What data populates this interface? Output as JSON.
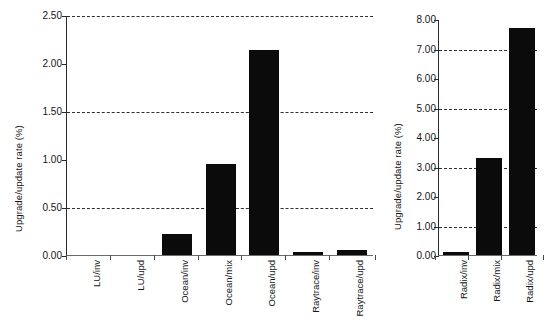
{
  "figure": {
    "background": "#ffffff",
    "bar_color": "#0b0b0b",
    "axis_color": "#2b2b2b",
    "grid_color": "#2e2e2e"
  },
  "chart_data": [
    {
      "type": "bar",
      "panel": "left",
      "title": "",
      "xlabel": "",
      "ylabel": "Upgrade/update rate (%)",
      "categories": [
        "LU/inv",
        "LU/upd",
        "Ocean/inv",
        "Ocean/mix",
        "Ocean/upd",
        "Raytrace/inv",
        "Raytrace/upd"
      ],
      "values": [
        0.0,
        0.0,
        0.22,
        0.95,
        2.14,
        0.03,
        0.05
      ],
      "ylim": [
        0.0,
        2.5
      ],
      "ytick_values": [
        0.0,
        0.5,
        1.0,
        1.5,
        2.0,
        2.5
      ],
      "ytick_labels": [
        "0.00",
        "0.50",
        "1.00",
        "1.50",
        "2.00",
        "2.50"
      ],
      "gridlines_at": [
        0.5,
        1.5,
        2.5
      ],
      "grid": "horizontal-dashed",
      "legend": "none"
    },
    {
      "type": "bar",
      "panel": "right",
      "title": "",
      "xlabel": "",
      "ylabel": "Upgrade/update rate (%)",
      "categories": [
        "Radix/inv",
        "Radix/mix",
        "Radix/upd"
      ],
      "values": [
        0.1,
        3.3,
        7.7
      ],
      "ylim": [
        0.0,
        8.0
      ],
      "ytick_values": [
        0.0,
        1.0,
        2.0,
        3.0,
        4.0,
        5.0,
        6.0,
        7.0,
        8.0
      ],
      "ytick_labels": [
        "0.00",
        "1.00",
        "2.00",
        "3.00",
        "4.00",
        "5.00",
        "6.00",
        "7.00",
        "8.00"
      ],
      "gridlines_at": [
        1.0,
        3.0,
        5.0,
        7.0
      ],
      "grid": "horizontal-dashed",
      "legend": "none"
    }
  ]
}
